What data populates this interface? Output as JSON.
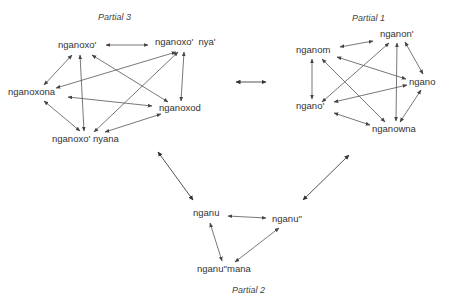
{
  "diagram": {
    "type": "graph",
    "partials": [
      {
        "id": "p3",
        "title": "Partial 3",
        "nodes": [
          {
            "id": "a",
            "label": "nganoxo'"
          },
          {
            "id": "b",
            "label": "nganoxo'  nya'"
          },
          {
            "id": "c",
            "label": "nganoxona"
          },
          {
            "id": "d",
            "label": "nganoxod"
          },
          {
            "id": "e",
            "label": "nganoxo' nyana"
          }
        ]
      },
      {
        "id": "p1",
        "title": "Partial 1",
        "nodes": [
          {
            "id": "f",
            "label": "nganon'"
          },
          {
            "id": "g",
            "label": "nganom"
          },
          {
            "id": "h",
            "label": "ngano"
          },
          {
            "id": "i",
            "label": "ngano'"
          },
          {
            "id": "j",
            "label": "nganowna"
          }
        ]
      },
      {
        "id": "p2",
        "title": "Partial 2",
        "nodes": [
          {
            "id": "k",
            "label": "nganu"
          },
          {
            "id": "l",
            "label": "nganu''"
          },
          {
            "id": "m",
            "label": "nganu''mana"
          }
        ]
      }
    ],
    "edge_style": "bidirectional",
    "edge_color": "#555555",
    "text_color": "#333333"
  }
}
